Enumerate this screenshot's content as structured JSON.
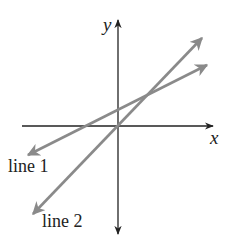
{
  "diagram": {
    "type": "coordinate-plane",
    "axes": {
      "x_label": "x",
      "y_label": "y",
      "axis_color": "#222222"
    },
    "lines": [
      {
        "label": "line 1",
        "color": "#8a8a8a",
        "start": [
          28,
          155
        ],
        "end": [
          207,
          65
        ],
        "description": "shallower slope, positive y-intercept"
      },
      {
        "label": "line 2",
        "color": "#8a8a8a",
        "start": [
          33,
          214
        ],
        "end": [
          202,
          38
        ],
        "description": "steeper slope, passes near origin"
      }
    ]
  }
}
